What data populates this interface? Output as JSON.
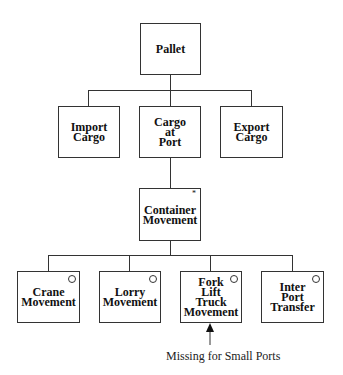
{
  "nodes": {
    "pallet": "Pallet",
    "import_cargo": "Import\nCargo",
    "cargo_at_port": "Cargo\nat\nPort",
    "export_cargo": "Export\nCargo",
    "container_movement": "Container\nMovement",
    "container_marker": "*",
    "crane_movement": "Crane\nMovement",
    "lorry_movement": "Lorry\nMovement",
    "fork_lift": "Fork\nLift\nTruck\nMovement",
    "inter_port": "Inter\nPort\nTransfer"
  },
  "annotation": "Missing for Small Ports"
}
